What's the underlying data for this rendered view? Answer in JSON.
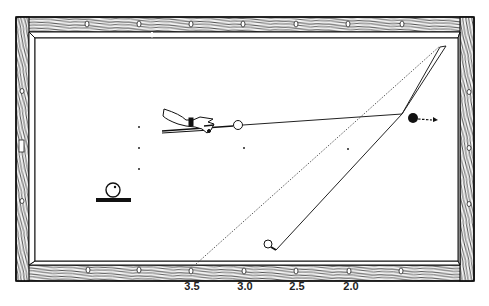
{
  "diagram": {
    "type": "billiard-table-system",
    "colors": {
      "ink": "#1a1a1a",
      "felt": "#ffffff",
      "rail_bg": "#f2f2f2"
    },
    "table": {
      "outer": {
        "x": 16,
        "y": 17,
        "w": 458,
        "h": 264
      },
      "inner": {
        "x": 35,
        "y": 38,
        "w": 423,
        "h": 223
      }
    },
    "diamond_numbers": [
      {
        "label": "3.5",
        "x": 191
      },
      {
        "label": "3.0",
        "x": 243
      },
      {
        "label": "2.5",
        "x": 295
      },
      {
        "label": "2.0",
        "x": 348
      }
    ],
    "cue_ball": {
      "x": 238,
      "y": 125,
      "r": 4.5,
      "fill": "white"
    },
    "object_ball": {
      "x": 413,
      "y": 118,
      "r": 5,
      "fill": "black"
    },
    "end_ball": {
      "x": 268,
      "y": 244,
      "r": 4,
      "fill": "white"
    },
    "legend_ball": {
      "label": "ball-with-english-indicator"
    },
    "labels": {
      "hand": "cue-stroke-hand"
    }
  }
}
